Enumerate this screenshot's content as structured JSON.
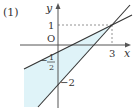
{
  "problem_label": "(1)",
  "axes": {
    "x_label": "x",
    "y_label": "y",
    "origin_label": "O"
  },
  "ticks": {
    "y_one": "1",
    "x_three": "3",
    "y_neg_half_sign": "−",
    "y_neg_half_num": "1",
    "y_neg_half_den": "2",
    "y_neg_two": "−2"
  },
  "lines": [
    {
      "name": "line-1",
      "equation": "y = x/2 - 1/2",
      "y_intercept": -0.5,
      "passes_through": [
        3,
        1
      ]
    },
    {
      "name": "line-2",
      "equation": "y = x - 2",
      "y_intercept": -2,
      "passes_through": [
        3,
        1
      ]
    }
  ],
  "intersection": [
    3,
    1
  ],
  "colors": {
    "shade": "#dff3f8",
    "line": "#333333",
    "axis": "#555555",
    "dash": "#777777"
  }
}
